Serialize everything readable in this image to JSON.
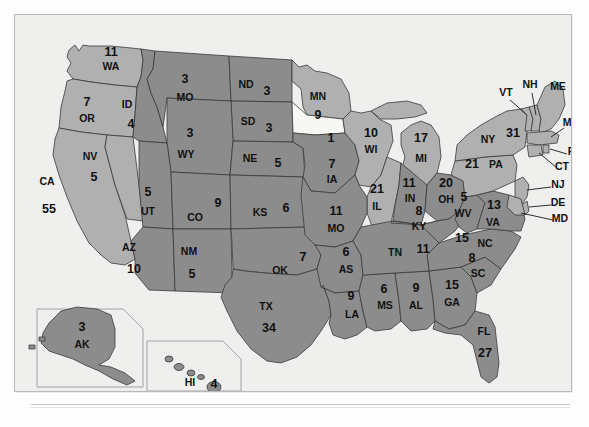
{
  "figure": {
    "kind": "us-electoral-college-map",
    "frame_border_color": "#b9b9b9",
    "background_color": "#efefee",
    "land_outline_color": "#2e2e2e"
  },
  "legend_colors": {
    "red_state_fill": "#8c8c8c",
    "blue_state_fill": "#b0b0b0",
    "unshaded_fill": "#f7f7f3",
    "label_text": "#111111"
  },
  "chart_data": {
    "type": "map",
    "title": "",
    "value_label": "electoral votes",
    "categories": [
      "WA",
      "OR",
      "CA",
      "NV",
      "ID",
      "MO",
      "ND",
      "SD",
      "WY",
      "NE",
      "UT",
      "CO",
      "KS",
      "AZ",
      "NM",
      "OK",
      "TX",
      "MN",
      "IA",
      "WI",
      "IL",
      "MI",
      "IN",
      "OH",
      "MO2",
      "AS",
      "LA",
      "MS",
      "AL",
      "GA",
      "FL",
      "SC",
      "NC",
      "TN",
      "KY",
      "WV",
      "VA",
      "PA",
      "NY",
      "VT",
      "NH",
      "ME",
      "MA",
      "RI",
      "CT",
      "NJ",
      "DE",
      "MD",
      "AK",
      "HI",
      "UNLABELED"
    ],
    "values": [
      11,
      7,
      55,
      5,
      4,
      3,
      3,
      3,
      3,
      5,
      5,
      9,
      6,
      10,
      5,
      7,
      34,
      9,
      7,
      10,
      21,
      17,
      11,
      20,
      11,
      6,
      9,
      6,
      9,
      15,
      27,
      8,
      15,
      11,
      8,
      5,
      13,
      21,
      31,
      3,
      4,
      4,
      12,
      4,
      7,
      15,
      3,
      10,
      3,
      4,
      1
    ]
  },
  "states": [
    {
      "id": "WA",
      "abbr": "WA",
      "value": "11",
      "shade": "light",
      "abbr_x": 96,
      "abbr_y": 55,
      "val_x": 96,
      "val_y": 41
    },
    {
      "id": "OR",
      "abbr": "OR",
      "value": "7",
      "shade": "light",
      "abbr_x": 72,
      "abbr_y": 107,
      "val_x": 72,
      "val_y": 91
    },
    {
      "id": "CA",
      "abbr": "CA",
      "value": "55",
      "shade": "light",
      "abbr_x": 32,
      "abbr_y": 170,
      "val_x": 34,
      "val_y": 198
    },
    {
      "id": "NV",
      "abbr": "NV",
      "value": "5",
      "shade": "light",
      "abbr_x": 75,
      "abbr_y": 145,
      "val_x": 79,
      "val_y": 166
    },
    {
      "id": "ID",
      "abbr": "ID",
      "value": "4",
      "shade": "dark",
      "abbr_x": 112,
      "abbr_y": 93,
      "val_x": 116,
      "val_y": 113
    },
    {
      "id": "MT",
      "abbr": "MO",
      "value": "3",
      "shade": "dark",
      "abbr_x": 170,
      "abbr_y": 86,
      "val_x": 170,
      "val_y": 68
    },
    {
      "id": "ND",
      "abbr": "ND",
      "value": "3",
      "shade": "dark",
      "abbr_x": 231,
      "abbr_y": 73,
      "val_x": 252,
      "val_y": 80
    },
    {
      "id": "SD",
      "abbr": "SD",
      "value": "3",
      "shade": "dark",
      "abbr_x": 233,
      "abbr_y": 110,
      "val_x": 254,
      "val_y": 117
    },
    {
      "id": "WY",
      "abbr": "WY",
      "value": "3",
      "shade": "dark",
      "abbr_x": 171,
      "abbr_y": 143,
      "val_x": 175,
      "val_y": 122
    },
    {
      "id": "NE",
      "abbr": "NE",
      "value": "5",
      "shade": "dark",
      "abbr_x": 235,
      "abbr_y": 147,
      "val_x": 263,
      "val_y": 152
    },
    {
      "id": "UT",
      "abbr": "UT",
      "value": "5",
      "shade": "dark",
      "abbr_x": 133,
      "abbr_y": 200,
      "val_x": 133,
      "val_y": 181
    },
    {
      "id": "CO",
      "abbr": "CO",
      "value": "9",
      "shade": "dark",
      "abbr_x": 180,
      "abbr_y": 206,
      "val_x": 203,
      "val_y": 192
    },
    {
      "id": "KS",
      "abbr": "KS",
      "value": "6",
      "shade": "dark",
      "abbr_x": 245,
      "abbr_y": 201,
      "val_x": 271,
      "val_y": 197
    },
    {
      "id": "AZ",
      "abbr": "AZ",
      "value": "10",
      "shade": "dark",
      "abbr_x": 114,
      "abbr_y": 236,
      "val_x": 119,
      "val_y": 258
    },
    {
      "id": "NM",
      "abbr": "NM",
      "value": "5",
      "shade": "dark",
      "abbr_x": 174,
      "abbr_y": 240,
      "val_x": 177,
      "val_y": 263
    },
    {
      "id": "OK",
      "abbr": "OK",
      "value": "7",
      "shade": "dark",
      "abbr_x": 265,
      "abbr_y": 259,
      "val_x": 288,
      "val_y": 246
    },
    {
      "id": "TX",
      "abbr": "TX",
      "value": "34",
      "shade": "dark",
      "abbr_x": 251,
      "abbr_y": 295,
      "val_x": 254,
      "val_y": 317
    },
    {
      "id": "MN",
      "abbr": "MN",
      "value": "9",
      "shade": "light",
      "abbr_x": 303,
      "abbr_y": 85,
      "val_x": 303,
      "val_y": 104
    },
    {
      "id": "IA",
      "abbr": "IA",
      "value": "7",
      "shade": "dark",
      "abbr_x": 317,
      "abbr_y": 168,
      "val_x": 317,
      "val_y": 153
    },
    {
      "id": "WI",
      "abbr": "WI",
      "value": "10",
      "shade": "light",
      "abbr_x": 356,
      "abbr_y": 138,
      "val_x": 356,
      "val_y": 122
    },
    {
      "id": "IL",
      "abbr": "IL",
      "value": "21",
      "shade": "light",
      "abbr_x": 362,
      "abbr_y": 195,
      "val_x": 362,
      "val_y": 178
    },
    {
      "id": "MI",
      "abbr": "MI",
      "value": "17",
      "shade": "light",
      "abbr_x": 406,
      "abbr_y": 147,
      "val_x": 406,
      "val_y": 127
    },
    {
      "id": "IN",
      "abbr": "IN",
      "value": "11",
      "shade": "dark",
      "abbr_x": 395,
      "abbr_y": 187,
      "val_x": 394,
      "val_y": 172
    },
    {
      "id": "OH",
      "abbr": "OH",
      "value": "20",
      "shade": "dark",
      "abbr_x": 431,
      "abbr_y": 188,
      "val_x": 431,
      "val_y": 172
    },
    {
      "id": "MO",
      "abbr": "MO",
      "value": "11",
      "shade": "dark",
      "abbr_x": 321,
      "abbr_y": 217,
      "val_x": 321,
      "val_y": 200
    },
    {
      "id": "AR",
      "abbr": "AS",
      "value": "6",
      "shade": "dark",
      "abbr_x": 331,
      "abbr_y": 258,
      "val_x": 331,
      "val_y": 241
    },
    {
      "id": "LA",
      "abbr": "LA",
      "value": "9",
      "shade": "dark",
      "abbr_x": 337,
      "abbr_y": 303,
      "val_x": 336,
      "val_y": 285
    },
    {
      "id": "MS",
      "abbr": "MS",
      "value": "6",
      "shade": "dark",
      "abbr_x": 370,
      "abbr_y": 294,
      "val_x": 369,
      "val_y": 278
    },
    {
      "id": "AL",
      "abbr": "AL",
      "value": "9",
      "shade": "dark",
      "abbr_x": 401,
      "abbr_y": 294,
      "val_x": 401,
      "val_y": 277
    },
    {
      "id": "GA",
      "abbr": "GA",
      "value": "15",
      "shade": "dark",
      "abbr_x": 437,
      "abbr_y": 291,
      "val_x": 437,
      "val_y": 274
    },
    {
      "id": "FL",
      "abbr": "FL",
      "value": "27",
      "shade": "dark",
      "abbr_x": 469,
      "abbr_y": 320,
      "val_x": 470,
      "val_y": 342
    },
    {
      "id": "SC",
      "abbr": "SC",
      "value": "8",
      "shade": "dark",
      "abbr_x": 463,
      "abbr_y": 262,
      "val_x": 457,
      "val_y": 247
    },
    {
      "id": "NC",
      "abbr": "NC",
      "value": "15",
      "shade": "dark",
      "abbr_x": 470,
      "abbr_y": 232,
      "val_x": 447,
      "val_y": 227
    },
    {
      "id": "TN",
      "abbr": "TN",
      "value": "11",
      "shade": "dark",
      "abbr_x": 380,
      "abbr_y": 241,
      "val_x": 408,
      "val_y": 238
    },
    {
      "id": "KY",
      "abbr": "KY",
      "value": "8",
      "shade": "dark",
      "abbr_x": 404,
      "abbr_y": 215,
      "val_x": 404,
      "val_y": 200
    },
    {
      "id": "WV",
      "abbr": "WV",
      "value": "5",
      "shade": "dark",
      "abbr_x": 448,
      "abbr_y": 202,
      "val_x": 449,
      "val_y": 186
    },
    {
      "id": "VA",
      "abbr": "VA",
      "value": "13",
      "shade": "dark",
      "abbr_x": 478,
      "abbr_y": 211,
      "val_x": 479,
      "val_y": 194
    },
    {
      "id": "PA",
      "abbr": "PA",
      "value": "21",
      "shade": "light",
      "abbr_x": 481,
      "abbr_y": 153,
      "val_x": 457,
      "val_y": 153
    },
    {
      "id": "NY",
      "abbr": "NY",
      "value": "31",
      "shade": "light",
      "abbr_x": 473,
      "abbr_y": 128,
      "val_x": 498,
      "val_y": 122
    },
    {
      "id": "IA_UNLAB",
      "abbr": "",
      "value": "1",
      "shade": "none",
      "abbr_x": 0,
      "abbr_y": 0,
      "val_x": 316,
      "val_y": 127
    }
  ],
  "callout_labels": [
    {
      "id": "VT",
      "abbr": "VT",
      "x": 491,
      "y": 81
    },
    {
      "id": "NH",
      "abbr": "NH",
      "x": 515,
      "y": 73
    },
    {
      "id": "ME",
      "abbr": "ME",
      "x": 543,
      "y": 75
    },
    {
      "id": "MA",
      "abbr": "MA",
      "x": 556,
      "y": 111
    },
    {
      "id": "RI",
      "abbr": "RI",
      "x": 558,
      "y": 140
    },
    {
      "id": "CT",
      "abbr": "CT",
      "x": 547,
      "y": 155
    },
    {
      "id": "NJ",
      "abbr": "NJ",
      "x": 543,
      "y": 173
    },
    {
      "id": "DE",
      "abbr": "DE",
      "x": 543,
      "y": 191
    },
    {
      "id": "MD",
      "abbr": "MD",
      "x": 545,
      "y": 207
    }
  ],
  "insets": [
    {
      "id": "AK",
      "abbr": "AK",
      "value": "3",
      "shade": "dark",
      "abbr_x": 67,
      "abbr_y": 333,
      "val_x": 67,
      "val_y": 316
    },
    {
      "id": "HI",
      "abbr": "HI",
      "value": "4",
      "shade": "dark",
      "abbr_x": 175,
      "abbr_y": 371,
      "val_x": 199,
      "val_y": 373
    }
  ]
}
